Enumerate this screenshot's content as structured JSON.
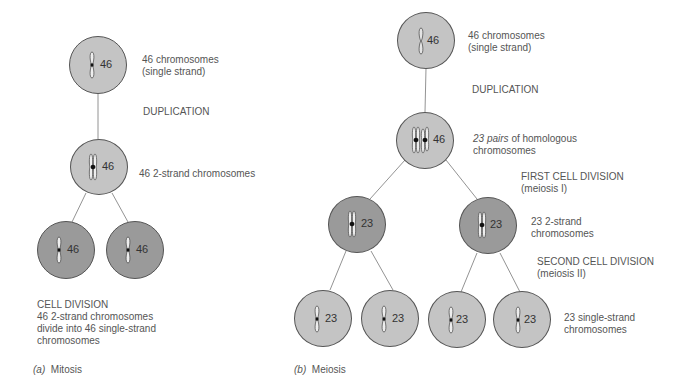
{
  "mitosis": {
    "cells": [
      {
        "count": "46"
      },
      {
        "count": "46"
      },
      {
        "count": "46"
      },
      {
        "count": "46"
      }
    ],
    "labels": {
      "top_line1": "46 chromosomes",
      "top_line2": "(single strand)",
      "duplication": "DUPLICATION",
      "two_strand": "46 2-strand chromosomes",
      "cell_division_title": "CELL DIVISION",
      "cell_division_line1": "46 2-strand chromosomes",
      "cell_division_line2": "divide into 46 single-strand",
      "cell_division_line3": "chromosomes"
    },
    "caption_letter": "(a)",
    "caption_text": "Mitosis"
  },
  "meiosis": {
    "cells": [
      {
        "count": "46"
      },
      {
        "count": "46"
      },
      {
        "count": "23"
      },
      {
        "count": "23"
      },
      {
        "count": "23"
      },
      {
        "count": "23"
      },
      {
        "count": "23"
      },
      {
        "count": "23"
      }
    ],
    "labels": {
      "top_line1": "46 chromosomes",
      "top_line2": "(single strand)",
      "duplication": "DUPLICATION",
      "pairs_num": "23",
      "pairs_italic": "pairs",
      "pairs_rest": "of  homologous",
      "pairs_line2": "chromosomes",
      "first_division": "FIRST CELL DIVISION",
      "first_division_sub": "(meiosis I)",
      "two_strand_line1": "23 2-strand",
      "two_strand_line2": "chromosomes",
      "second_division": "SECOND CELL DIVISION",
      "second_division_sub": "(meiosis II)",
      "single_strand_line1": "23 single-strand",
      "single_strand_line2": "chromosomes"
    },
    "caption_letter": "(b)",
    "caption_text": "Meiosis"
  },
  "colors": {
    "light_cell": "#c4c4c4",
    "dark_cell": "#9a9a9a",
    "text": "#555555"
  }
}
